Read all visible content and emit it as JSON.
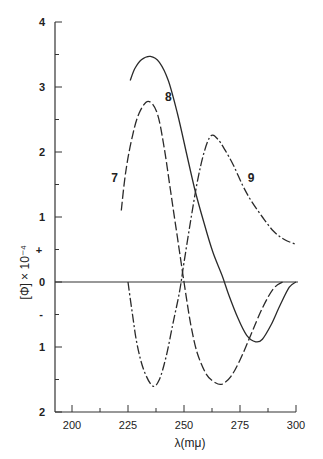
{
  "chart_data": {
    "type": "line",
    "title": "",
    "xlabel": "λ(mμ)",
    "ylabel": "[Φ] × 10⁻⁴",
    "xlim": [
      192,
      302
    ],
    "ylim": [
      -2,
      4
    ],
    "x_ticks": [
      200,
      225,
      250,
      275,
      300
    ],
    "y_ticks": [
      {
        "value": 4,
        "label": "4"
      },
      {
        "value": 3,
        "label": "3"
      },
      {
        "value": 2,
        "label": "2"
      },
      {
        "value": 1,
        "label": "1"
      },
      {
        "value": 0,
        "label": "0"
      },
      {
        "value": -1,
        "label": "1"
      },
      {
        "value": -2,
        "label": "2"
      }
    ],
    "sign_markers": {
      "plus": "+",
      "minus": "-"
    },
    "grid": false,
    "zero_line": true,
    "series": [
      {
        "name": "7",
        "style": "long-dash",
        "label_pos": [
          219,
          1.6
        ],
        "points": [
          [
            222,
            1.1
          ],
          [
            224,
            1.7
          ],
          [
            227,
            2.25
          ],
          [
            230,
            2.6
          ],
          [
            234,
            2.78
          ],
          [
            238,
            2.6
          ],
          [
            241,
            2.1
          ],
          [
            244,
            1.4
          ],
          [
            247,
            0.7
          ],
          [
            250,
            0.0
          ],
          [
            253,
            -0.65
          ],
          [
            256,
            -1.1
          ],
          [
            260,
            -1.42
          ],
          [
            264,
            -1.55
          ],
          [
            267,
            -1.57
          ],
          [
            271,
            -1.45
          ],
          [
            275,
            -1.2
          ],
          [
            280,
            -0.8
          ],
          [
            285,
            -0.4
          ],
          [
            290,
            -0.1
          ],
          [
            294,
            0.0
          ]
        ]
      },
      {
        "name": "8",
        "style": "solid",
        "label_pos": [
          243,
          2.85
        ],
        "points": [
          [
            226,
            3.1
          ],
          [
            228,
            3.28
          ],
          [
            231,
            3.42
          ],
          [
            235,
            3.47
          ],
          [
            239,
            3.38
          ],
          [
            243,
            3.1
          ],
          [
            247,
            2.6
          ],
          [
            251,
            2.0
          ],
          [
            255,
            1.4
          ],
          [
            259,
            0.9
          ],
          [
            263,
            0.45
          ],
          [
            267,
            0.1
          ],
          [
            270,
            -0.2
          ],
          [
            274,
            -0.55
          ],
          [
            278,
            -0.82
          ],
          [
            282,
            -0.92
          ],
          [
            285,
            -0.88
          ],
          [
            289,
            -0.65
          ],
          [
            293,
            -0.35
          ],
          [
            297,
            -0.08
          ],
          [
            300,
            0.0
          ]
        ]
      },
      {
        "name": "9",
        "style": "dash-dot",
        "label_pos": [
          280,
          1.6
        ],
        "points": [
          [
            225,
            0.0
          ],
          [
            227,
            -0.5
          ],
          [
            229,
            -0.95
          ],
          [
            232,
            -1.35
          ],
          [
            236,
            -1.6
          ],
          [
            239,
            -1.5
          ],
          [
            242,
            -1.15
          ],
          [
            245,
            -0.65
          ],
          [
            248,
            -0.15
          ],
          [
            250,
            0.3
          ],
          [
            253,
            0.95
          ],
          [
            256,
            1.55
          ],
          [
            259,
            2.0
          ],
          [
            262,
            2.25
          ],
          [
            265,
            2.2
          ],
          [
            268,
            2.05
          ],
          [
            272,
            1.8
          ],
          [
            276,
            1.5
          ],
          [
            280,
            1.25
          ],
          [
            285,
            1.0
          ],
          [
            290,
            0.78
          ],
          [
            295,
            0.65
          ],
          [
            300,
            0.58
          ]
        ]
      }
    ]
  }
}
